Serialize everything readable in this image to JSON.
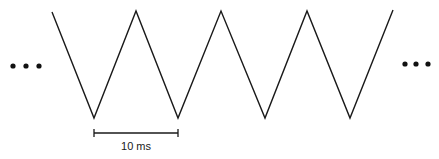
{
  "diagram": {
    "type": "triangle-wave",
    "waveform_points": [
      [
        52,
        12
      ],
      [
        94,
        118
      ],
      [
        136,
        11
      ],
      [
        178,
        118
      ],
      [
        221,
        11
      ],
      [
        265,
        118
      ],
      [
        307,
        11
      ],
      [
        350,
        118
      ],
      [
        393,
        10
      ]
    ],
    "continuation_left": "...",
    "continuation_right": "...",
    "scale_bar": {
      "label": "10 ms",
      "x_start": 94,
      "x_end": 178,
      "y": 133
    },
    "stroke_color": "#1a1a1a"
  }
}
